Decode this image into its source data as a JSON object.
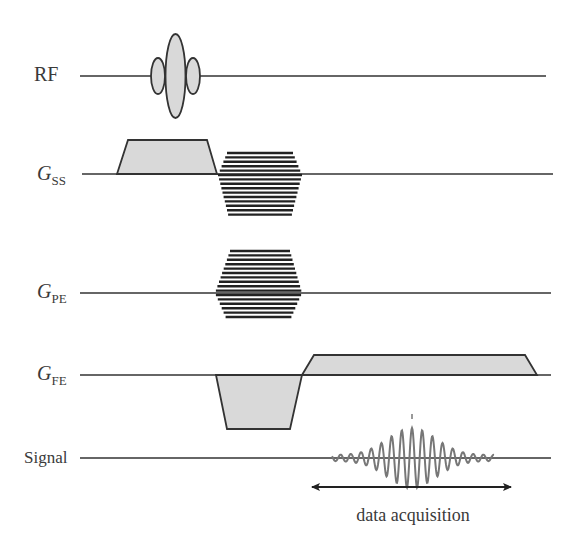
{
  "diagram": {
    "title": "",
    "type": "pulse-sequence-timing-diagram",
    "rows": [
      {
        "key": "rf",
        "label": "RF",
        "subscript": "",
        "baseline_y": 76,
        "x_start": 80,
        "x_end": 546
      },
      {
        "key": "gss",
        "label": "G",
        "subscript": "SS",
        "baseline_y": 174,
        "x_start": 82,
        "x_end": 553
      },
      {
        "key": "gpe",
        "label": "G",
        "subscript": "PE",
        "baseline_y": 293,
        "x_start": 80,
        "x_end": 551
      },
      {
        "key": "gfe",
        "label": "G",
        "subscript": "FE",
        "baseline_y": 375,
        "x_start": 80,
        "x_end": 551
      },
      {
        "key": "signal",
        "label": "Signal",
        "subscript": "",
        "baseline_y": 458,
        "x_start": 80,
        "x_end": 551
      }
    ],
    "annotation": {
      "label": "data acquisition",
      "arrow": "double-headed",
      "x_start": 310,
      "x_end": 513
    },
    "colors": {
      "lobe_fill": "#d9d9d9",
      "line": "#333333",
      "signal": "#777777",
      "text": "#3a3a3a"
    }
  }
}
